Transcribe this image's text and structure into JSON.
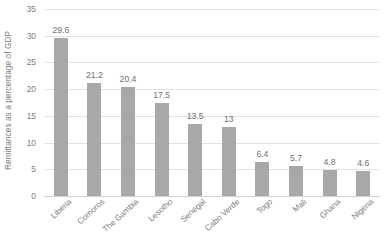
{
  "chart_data": {
    "type": "bar",
    "title": "",
    "xlabel": "",
    "ylabel": "Remittances as a percentage of GDP",
    "ylim": [
      0,
      35
    ],
    "ytick_step": 5,
    "yticks": [
      0,
      5,
      10,
      15,
      20,
      25,
      30,
      35
    ],
    "ytick_labels": [
      "0",
      "5",
      "10",
      "15",
      "20",
      "25",
      "30",
      "35"
    ],
    "grid": true,
    "legend": false,
    "legend_position": "none",
    "bar_color": "#a8a8a8",
    "gridline_color": "#e2e2e2",
    "text_color": "#7b7b7b",
    "categories": [
      "Liberia",
      "Comoros",
      "The Gambia",
      "Lesotho",
      "Senegal",
      "Cabo Verde",
      "Togo",
      "Mali",
      "Ghana",
      "Nigeria"
    ],
    "values": [
      29.6,
      21.2,
      20.4,
      17.5,
      13.5,
      13,
      6.4,
      5.7,
      4.8,
      4.6
    ],
    "data_labels": [
      "29.6",
      "21.2",
      "20.4",
      "17.5",
      "13.5",
      "13",
      "6.4",
      "5.7",
      "4.8",
      "4.6"
    ]
  }
}
